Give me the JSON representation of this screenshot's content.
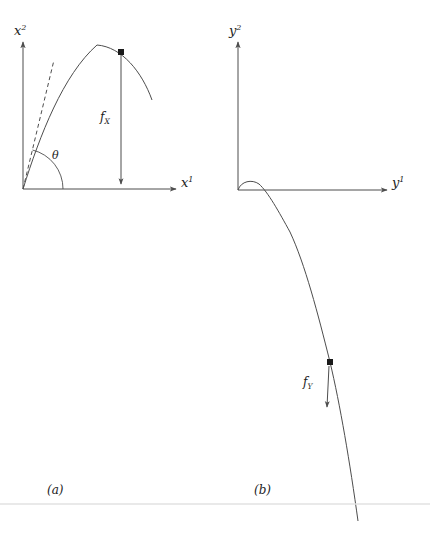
{
  "figure": {
    "width": 430,
    "height": 535,
    "background_color": "#ffffff",
    "stroke_color": "#4d4d4d",
    "text_color": "#222222",
    "rule_color": "#e2e2e2"
  },
  "panels": [
    {
      "id": "panel-a",
      "caption": "(a)",
      "origin": {
        "x": 23,
        "y": 189
      },
      "axes": {
        "vertical": {
          "label": "x",
          "superscript": "2",
          "from": {
            "x": 23,
            "y": 189
          },
          "to": {
            "x": 23,
            "y": 42
          }
        },
        "horizontal": {
          "label": "x",
          "superscript": "1",
          "from": {
            "x": 23,
            "y": 189
          },
          "to": {
            "x": 176,
            "y": 189
          }
        }
      },
      "curve": {
        "name": "trajectory-x",
        "description": "parabolic arc rising from origin to apex then falling",
        "points": [
          {
            "x": 23,
            "y": 189
          },
          {
            "x": 52,
            "y": 104
          },
          {
            "x": 78,
            "y": 60
          },
          {
            "x": 97,
            "y": 45
          },
          {
            "x": 121,
            "y": 52
          },
          {
            "x": 140,
            "y": 75
          },
          {
            "x": 152,
            "y": 100
          }
        ]
      },
      "tangent": {
        "name": "tangent-dashed",
        "from": {
          "x": 23,
          "y": 189
        },
        "to": {
          "x": 54,
          "y": 60
        },
        "style": "dashed"
      },
      "angle": {
        "label": "θ",
        "label_position": {
          "x": 52,
          "y": 150
        },
        "arc_radius": 40
      },
      "force": {
        "label": "f",
        "subscript": "X",
        "label_position": {
          "x": 100,
          "y": 111
        },
        "arrow_from": {
          "x": 121,
          "y": 54
        },
        "arrow_to": {
          "x": 121,
          "y": 184
        },
        "direction": "down"
      },
      "marker": {
        "name": "point-on-curve",
        "x": 121,
        "y": 52
      }
    },
    {
      "id": "panel-b",
      "caption": "(b)",
      "origin": {
        "x": 238,
        "y": 190
      },
      "axes": {
        "vertical": {
          "label": "y",
          "superscript": "2",
          "from": {
            "x": 238,
            "y": 190
          },
          "to": {
            "x": 238,
            "y": 42
          }
        },
        "horizontal": {
          "label": "y",
          "superscript": "1",
          "from": {
            "x": 238,
            "y": 190
          },
          "to": {
            "x": 387,
            "y": 190
          }
        }
      },
      "curve": {
        "name": "trajectory-y",
        "description": "small hump near origin then steep descent below axis",
        "points": [
          {
            "x": 238,
            "y": 190
          },
          {
            "x": 248,
            "y": 182
          },
          {
            "x": 258,
            "y": 183
          },
          {
            "x": 272,
            "y": 192
          },
          {
            "x": 290,
            "y": 230
          },
          {
            "x": 310,
            "y": 290
          },
          {
            "x": 330,
            "y": 362
          },
          {
            "x": 345,
            "y": 440
          },
          {
            "x": 358,
            "y": 520
          }
        ]
      },
      "force": {
        "label": "f",
        "subscript": "Y",
        "label_position": {
          "x": 303,
          "y": 376
        },
        "arrow_from": {
          "x": 329,
          "y": 366
        },
        "arrow_to": {
          "x": 327,
          "y": 407
        },
        "direction": "down"
      },
      "marker": {
        "name": "point-on-curve",
        "x": 330,
        "y": 362
      }
    }
  ],
  "rule": {
    "name": "horizontal-rule",
    "y": 504
  }
}
